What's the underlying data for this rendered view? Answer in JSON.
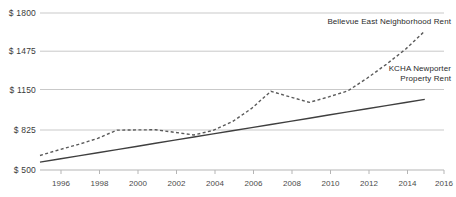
{
  "chart_data": {
    "type": "line",
    "title": "",
    "subtitle": "",
    "xlabel": "",
    "ylabel": "",
    "grid": true,
    "legend_position": "inline-annotation",
    "xlim": [
      1995,
      2016
    ],
    "ylim": [
      500,
      1800
    ],
    "y_ticks": [
      500,
      825,
      1150,
      1475,
      1800
    ],
    "y_tick_labels": [
      "$ 500",
      "$ 825",
      "$ 1150",
      "$ 1475",
      "$ 1800"
    ],
    "x_ticks": [
      1996,
      1998,
      2000,
      2002,
      2004,
      2006,
      2008,
      2010,
      2012,
      2014,
      2016
    ],
    "x_tick_labels": [
      "1996",
      "1998",
      "2000",
      "2002",
      "2004",
      "2006",
      "2008",
      "2010",
      "2012",
      "2014",
      "2016"
    ],
    "x": [
      1995,
      1996,
      1997,
      1998,
      1999,
      2000,
      2001,
      2002,
      2003,
      2004,
      2005,
      2006,
      2007,
      2008,
      2009,
      2010,
      2011,
      2012,
      2013,
      2014,
      2015
    ],
    "series": [
      {
        "name": "Bellevue East Neighborhood Rent",
        "style": "dashed",
        "color": "#5a5a5a",
        "values": [
          620,
          668,
          712,
          762,
          830,
          832,
          833,
          812,
          790,
          828,
          900,
          1010,
          1152,
          1105,
          1060,
          1105,
          1155,
          1260,
          1375,
          1500,
          1650
        ]
      },
      {
        "name": "KCHA Newporter Property Rent",
        "style": "solid",
        "color": "#3f3f3f",
        "values": [
          565,
          591,
          617,
          643,
          669,
          695,
          721,
          747,
          773,
          799,
          825,
          851,
          877,
          903,
          929,
          955,
          981,
          1007,
          1033,
          1059,
          1085
        ]
      }
    ],
    "annotations": [
      {
        "id": "bellevue-label",
        "text": "Bellevue East Neighborhood Rent",
        "lines": [
          "Bellevue East Neighborhood Rent"
        ],
        "align": "end",
        "x": 451,
        "y": 24
      },
      {
        "id": "kcha-label",
        "text": "KCHA Newporter Property Rent",
        "lines": [
          "KCHA Newporter",
          "Property Rent"
        ],
        "align": "end",
        "x": 451,
        "y": 71
      }
    ],
    "colors": {
      "grid": "#c9c9c9",
      "axis": "#b5b5b5",
      "text": "#3a3a3a",
      "series_dashed": "#5a5a5a",
      "series_solid": "#3f3f3f",
      "background": "#ffffff"
    }
  }
}
